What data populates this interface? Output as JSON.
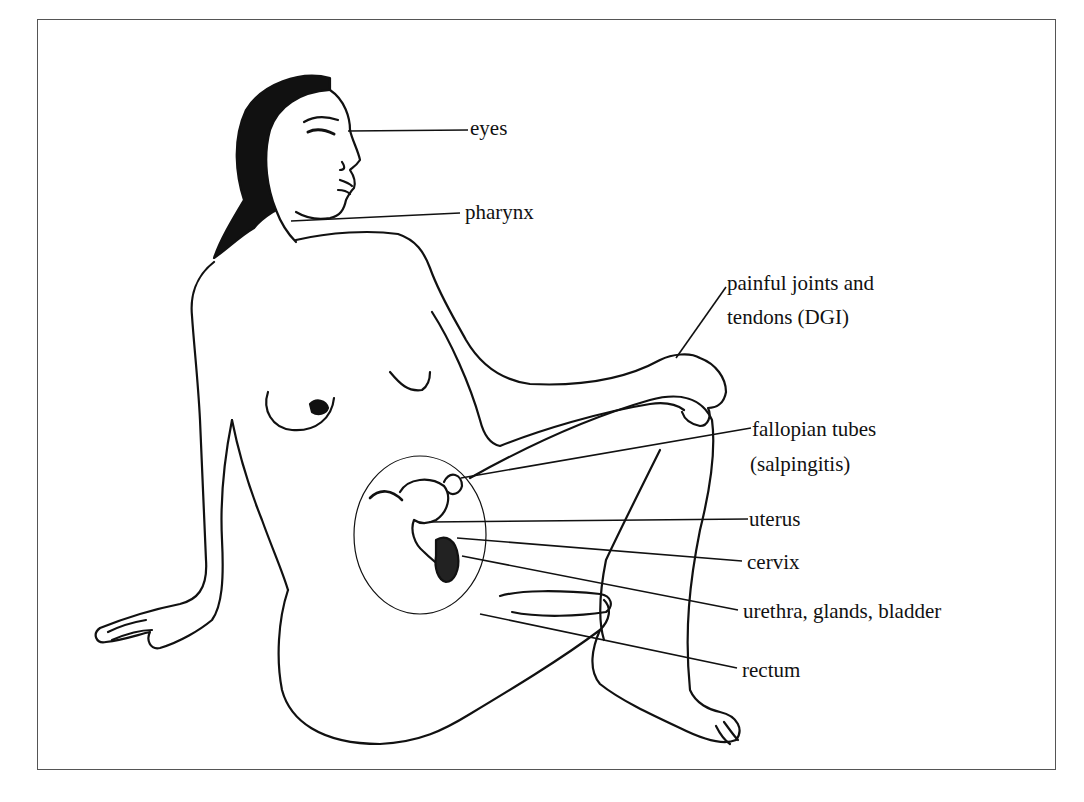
{
  "figure": {
    "line_color": "#111111",
    "frame_color": "#555555",
    "background": "#ffffff"
  },
  "labels": [
    {
      "id": "eyes",
      "text": "eyes",
      "x": 470,
      "y": 116
    },
    {
      "id": "pharynx",
      "text": "pharynx",
      "x": 465,
      "y": 200
    },
    {
      "id": "joints-line1",
      "text": "painful joints and",
      "x": 727,
      "y": 271
    },
    {
      "id": "joints-line2",
      "text": "tendons (DGI)",
      "x": 727,
      "y": 305
    },
    {
      "id": "fallopian-line1",
      "text": "fallopian tubes",
      "x": 752,
      "y": 417
    },
    {
      "id": "fallopian-line2",
      "text": "(salpingitis)",
      "x": 750,
      "y": 452
    },
    {
      "id": "uterus",
      "text": "uterus",
      "x": 749,
      "y": 507
    },
    {
      "id": "cervix",
      "text": "cervix",
      "x": 747,
      "y": 550
    },
    {
      "id": "urethra",
      "text": "urethra, glands, bladder",
      "x": 743,
      "y": 599
    },
    {
      "id": "rectum",
      "text": "rectum",
      "x": 742,
      "y": 658
    }
  ],
  "leaders": [
    {
      "id": "eyes",
      "x1": 348,
      "y1": 131,
      "x2": 468,
      "y2": 130
    },
    {
      "id": "pharynx",
      "x1": 291,
      "y1": 221,
      "x2": 460,
      "y2": 213
    },
    {
      "id": "joints",
      "x1": 676,
      "y1": 358,
      "x2": 726,
      "y2": 287
    },
    {
      "id": "fallopian",
      "x1": 461,
      "y1": 478,
      "x2": 751,
      "y2": 428
    },
    {
      "id": "uterus",
      "x1": 429,
      "y1": 522,
      "x2": 748,
      "y2": 519
    },
    {
      "id": "cervix",
      "x1": 457,
      "y1": 538,
      "x2": 742,
      "y2": 561
    },
    {
      "id": "urethra",
      "x1": 462,
      "y1": 556,
      "x2": 738,
      "y2": 610
    },
    {
      "id": "rectum",
      "x1": 480,
      "y1": 614,
      "x2": 737,
      "y2": 668
    }
  ]
}
